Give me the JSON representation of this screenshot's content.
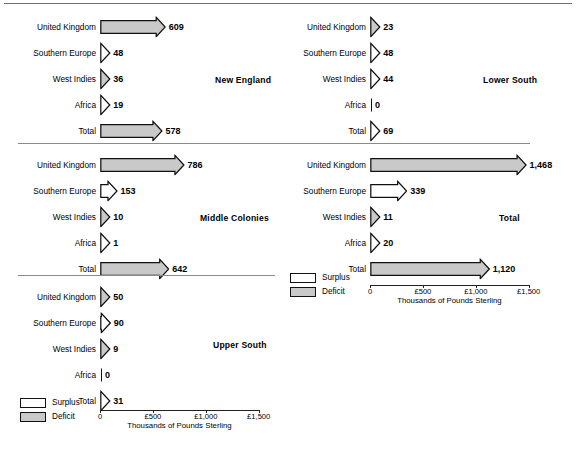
{
  "figure": {
    "axis": {
      "caption": "Thousands of Pounds Sterling",
      "ticks": [
        {
          "label": "0",
          "value": 0
        },
        {
          "label": "£500",
          "value": 500
        },
        {
          "label": "£1,000",
          "value": 1000
        },
        {
          "label": "£1,500",
          "value": 1500
        }
      ],
      "min": 0,
      "max": 1500
    },
    "legend": {
      "items": [
        {
          "label": "Surplus",
          "type": "surplus",
          "color": "#ffffff"
        },
        {
          "label": "Deficit",
          "type": "deficit",
          "color": "#c9c9c9"
        }
      ]
    }
  },
  "chart_data": {
    "type": "bar",
    "title": "",
    "xlabel": "Thousands of Pounds Sterling",
    "ylabel": "",
    "xlim": [
      0,
      1500
    ],
    "grid": false,
    "legend_position": "bottom-left",
    "unit": "Thousands of Pounds Sterling",
    "categories": [
      "United Kingdom",
      "Southern Europe",
      "West Indies",
      "Africa",
      "Total"
    ],
    "value_types": {
      "surplus": "Surplus",
      "deficit": "Deficit"
    },
    "panels": [
      {
        "name": "New England",
        "rows": [
          {
            "label": "United Kingdom",
            "value": 609,
            "display": "609",
            "type": "deficit"
          },
          {
            "label": "Southern Europe",
            "value": 48,
            "display": "48",
            "type": "surplus"
          },
          {
            "label": "West Indies",
            "value": 36,
            "display": "36",
            "type": "deficit"
          },
          {
            "label": "Africa",
            "value": 19,
            "display": "19",
            "type": "surplus"
          },
          {
            "label": "Total",
            "value": 578,
            "display": "578",
            "type": "deficit"
          }
        ]
      },
      {
        "name": "Lower South",
        "rows": [
          {
            "label": "United Kingdom",
            "value": 23,
            "display": "23",
            "type": "deficit"
          },
          {
            "label": "Southern Europe",
            "value": 48,
            "display": "48",
            "type": "surplus"
          },
          {
            "label": "West Indies",
            "value": 44,
            "display": "44",
            "type": "surplus"
          },
          {
            "label": "Africa",
            "value": 0,
            "display": "0",
            "type": "zero"
          },
          {
            "label": "Total",
            "value": 69,
            "display": "69",
            "type": "surplus"
          }
        ]
      },
      {
        "name": "Middle Colonies",
        "rows": [
          {
            "label": "United Kingdom",
            "value": 786,
            "display": "786",
            "type": "deficit"
          },
          {
            "label": "Southern Europe",
            "value": 153,
            "display": "153",
            "type": "surplus"
          },
          {
            "label": "West Indies",
            "value": 10,
            "display": "10",
            "type": "deficit"
          },
          {
            "label": "Africa",
            "value": 1,
            "display": "1",
            "type": "surplus"
          },
          {
            "label": "Total",
            "value": 642,
            "display": "642",
            "type": "deficit"
          }
        ]
      },
      {
        "name": "Total",
        "rows": [
          {
            "label": "United Kingdom",
            "value": 1468,
            "display": "1,468",
            "type": "deficit"
          },
          {
            "label": "Southern Europe",
            "value": 339,
            "display": "339",
            "type": "surplus"
          },
          {
            "label": "West Indies",
            "value": 11,
            "display": "11",
            "type": "deficit"
          },
          {
            "label": "Africa",
            "value": 20,
            "display": "20",
            "type": "surplus"
          },
          {
            "label": "Total",
            "value": 1120,
            "display": "1,120",
            "type": "deficit"
          }
        ]
      },
      {
        "name": "Upper South",
        "rows": [
          {
            "label": "United Kingdom",
            "value": 50,
            "display": "50",
            "type": "deficit"
          },
          {
            "label": "Southern Europe",
            "value": 90,
            "display": "90",
            "type": "surplus"
          },
          {
            "label": "West Indies",
            "value": 9,
            "display": "9",
            "type": "deficit"
          },
          {
            "label": "Africa",
            "value": 0,
            "display": "0",
            "type": "zero"
          },
          {
            "label": "Total",
            "value": 31,
            "display": "31",
            "type": "surplus"
          }
        ]
      }
    ]
  }
}
